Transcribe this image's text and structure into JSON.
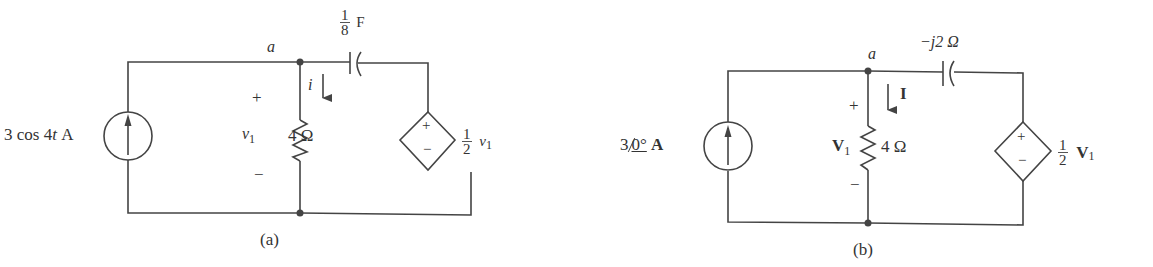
{
  "figure_a": {
    "caption": "(a)",
    "source_label_main": "3 cos 4",
    "source_label_t": "t",
    "source_label_unit": "A",
    "node_label": "a",
    "capacitor_num": "1",
    "capacitor_den": "8",
    "capacitor_unit": "F",
    "current_label": "i",
    "plus": "+",
    "minus": "−",
    "voltage_label": "v",
    "voltage_sub": "1",
    "resistor_label": "4 Ω",
    "dep_num": "1",
    "dep_den": "2",
    "dep_var": "v",
    "dep_sub": "1"
  },
  "figure_b": {
    "caption": "(b)",
    "source_mag": "3",
    "source_angle": "0°",
    "source_unit": "A",
    "node_label": "a",
    "capacitor_label": "−j2 Ω",
    "current_label": "I",
    "plus": "+",
    "minus": "−",
    "voltage_label": "V",
    "voltage_sub": "1",
    "resistor_label": "4 Ω",
    "dep_num": "1",
    "dep_den": "2",
    "dep_var": "V",
    "dep_sub": "1"
  }
}
